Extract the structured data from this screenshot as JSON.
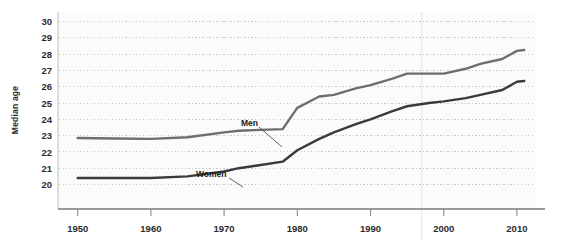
{
  "chart_data": {
    "type": "line",
    "title": "",
    "xlabel": "",
    "ylabel": "Median age",
    "xlim": [
      1947,
      2012
    ],
    "ylim": [
      19.5,
      30.4
    ],
    "yticks": [
      20,
      21,
      22,
      23,
      24,
      25,
      26,
      27,
      28,
      29,
      30
    ],
    "xticks": [
      1950,
      1960,
      1970,
      1980,
      1990,
      2000,
      2010
    ],
    "grid": "horizontal-dotted",
    "legend": "inline-annotations",
    "x": [
      1950,
      1955,
      1960,
      1965,
      1970,
      1972,
      1975,
      1978,
      1980,
      1983,
      1985,
      1988,
      1990,
      1993,
      1995,
      1998,
      2000,
      2003,
      2005,
      2008,
      2010,
      2011
    ],
    "series": [
      {
        "name": "Men",
        "color": "#6e6e6e",
        "values": [
          22.85,
          22.82,
          22.8,
          22.9,
          23.2,
          23.3,
          23.35,
          23.4,
          24.7,
          25.4,
          25.5,
          25.9,
          26.1,
          26.5,
          26.8,
          26.8,
          26.8,
          27.1,
          27.4,
          27.7,
          28.2,
          28.25
        ]
      },
      {
        "name": "Women",
        "color": "#3a3a3a",
        "values": [
          20.4,
          20.4,
          20.4,
          20.5,
          20.8,
          21.0,
          21.2,
          21.4,
          22.1,
          22.8,
          23.2,
          23.7,
          24.0,
          24.5,
          24.8,
          25.0,
          25.1,
          25.3,
          25.5,
          25.8,
          26.3,
          26.35
        ]
      }
    ],
    "annotations": [
      {
        "text": "Men",
        "label_x": 241,
        "label_y": 126,
        "leader_from_x": 259,
        "leader_from_y": 127,
        "leader_to_x": 282,
        "leader_to_y": 147
      },
      {
        "text": "Women",
        "label_x": 196,
        "label_y": 177,
        "leader_from_x": 229,
        "leader_from_y": 178,
        "leader_to_x": 243,
        "leader_to_y": 187
      }
    ]
  },
  "colors": {
    "plot_background": "#fbfbfb",
    "grid": "#c9c9c9",
    "axis": "#888888",
    "text": "#2b2b2b",
    "men_line": "#6e6e6e",
    "women_line": "#3a3a3a"
  }
}
